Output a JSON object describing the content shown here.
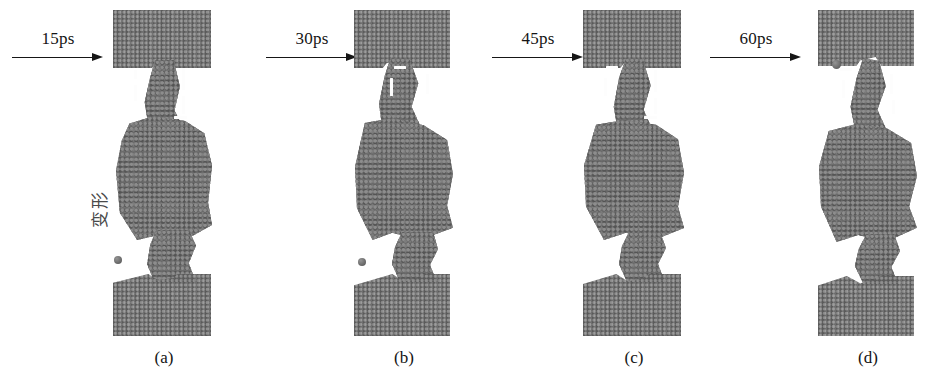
{
  "figure": {
    "type": "molecular-dynamics-snapshot-series",
    "background_color": "#ffffff",
    "atom_color": "#6e6e6e",
    "annotation_color": "#fdfdfd",
    "axis_label": {
      "text": "变形",
      "orientation": "vertical-rotated-90",
      "meaning": "deformation"
    }
  },
  "arrows": [
    {
      "label": "15ps",
      "name": "arrow-15ps"
    },
    {
      "label": "30ps",
      "name": "arrow-30ps"
    },
    {
      "label": "45ps",
      "name": "arrow-45ps"
    },
    {
      "label": "60ps",
      "name": "arrow-60ps"
    }
  ],
  "panels": [
    {
      "caption": "(a)",
      "time": "15ps",
      "description": "Crystalline upper and lower grip blocks with a broad amorphous necking region; dashed markers flank the upper neck; one detached stray atom at lower left.",
      "neck_width_relative": 0.62,
      "has_stray_atom": true,
      "dash_marks": 4
    },
    {
      "caption": "(b)",
      "time": "30ps",
      "description": "Neck narrows further and the lower void widens; amorphous core elongates between the grips.",
      "neck_width_relative": 0.52,
      "has_stray_atom": true,
      "dash_marks": 3
    },
    {
      "caption": "(c)",
      "time": "45ps",
      "description": "Upper neck thins noticeably; amorphous region pulled into an hourglass profile.",
      "neck_width_relative": 0.42,
      "has_stray_atom": false,
      "dash_marks": 4
    },
    {
      "caption": "(d)",
      "time": "60ps",
      "description": "Narrowest neck with the largest voids; near-fracture configuration and a detached atom near the top neck.",
      "neck_width_relative": 0.33,
      "has_stray_atom": true,
      "dash_marks": 4
    }
  ]
}
